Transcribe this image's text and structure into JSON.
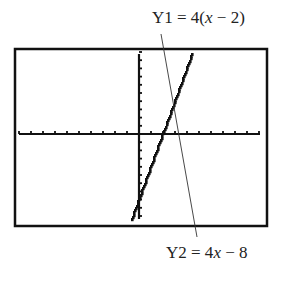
{
  "labels": {
    "y1": {
      "prefix": "Y1 = 4(",
      "var": "x",
      "suffix": " − 2)"
    },
    "y2": {
      "prefix": "Y2 = 4",
      "var": "x",
      "suffix": " − 8"
    }
  },
  "colors": {
    "ink": "#111111",
    "leader": "#333333",
    "background": "#ffffff"
  },
  "screen": {
    "x_ticks_left": 10,
    "x_ticks_right": 10,
    "y_ticks_up": 10,
    "y_ticks_down": 10
  },
  "chart_data": {
    "type": "line",
    "title": "",
    "xlabel": "",
    "ylabel": "",
    "xlim": [
      -10,
      10
    ],
    "ylim": [
      -10,
      10
    ],
    "grid": false,
    "series": [
      {
        "name": "Y1 = 4(x − 2)",
        "equation": "y = 4(x - 2)",
        "x": [
          0.5,
          4.5
        ],
        "y": [
          -6,
          10
        ]
      },
      {
        "name": "Y2 = 4x − 8",
        "equation": "y = 4x - 8",
        "x": [
          0.5,
          4.5
        ],
        "y": [
          -6,
          10
        ]
      }
    ],
    "annotations": [
      "Y1 = 4(x − 2)",
      "Y2 = 4x − 8"
    ],
    "note": "Both equations graph as the same line on a calculator screen"
  }
}
